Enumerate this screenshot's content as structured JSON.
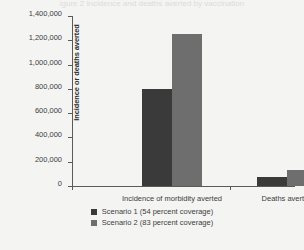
{
  "figure": {
    "title_sliver": "igure 2    Incidence and deaths averted by vaccination"
  },
  "colors": {
    "series1": "#3a3a3a",
    "series2": "#6e6e6e",
    "axis": "#5a5a5a",
    "background": "#f4f4f3",
    "text": "#3d3d3d"
  },
  "chart_data": {
    "type": "bar",
    "title": "",
    "xlabel": "",
    "ylabel": "Incidence or deaths averted",
    "categories": [
      "Incidence of morbidity averted",
      "Deaths averted"
    ],
    "series": [
      {
        "name": "Scenario 1 (54 percent coverage)",
        "color": "#3a3a3a",
        "values": [
          800000,
          75000
        ]
      },
      {
        "name": "Scenario 2 (83 percent coverage)",
        "color": "#6e6e6e",
        "values": [
          1250000,
          130000
        ]
      }
    ],
    "ylim": [
      0,
      1400000
    ],
    "yticks": [
      0,
      200000,
      400000,
      600000,
      800000,
      1000000,
      1200000,
      1400000
    ],
    "ytick_labels": [
      "0",
      "200,000",
      "400,000",
      "600,000",
      "800,000",
      "1,000,000",
      "1,200,000",
      "1,400,000"
    ],
    "grid": false,
    "legend_position": "bottom"
  }
}
